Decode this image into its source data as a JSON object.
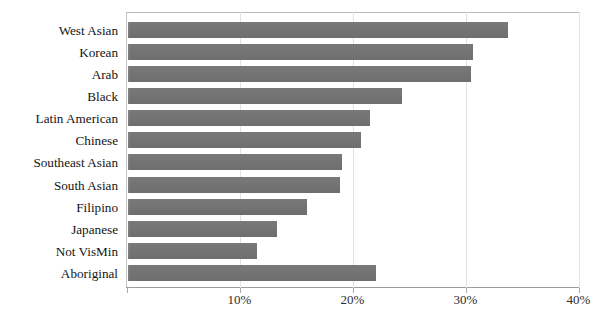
{
  "chart_data": {
    "type": "bar",
    "orientation": "horizontal",
    "title": "",
    "xlabel": "",
    "ylabel": "",
    "xlim": [
      0,
      40
    ],
    "xticks": [
      "10%",
      "20%",
      "30%",
      "40%"
    ],
    "xtick_values": [
      10,
      20,
      30,
      40
    ],
    "grid": true,
    "legend": null,
    "series_color": "#787878",
    "categories": [
      "West Asian",
      "Korean",
      "Arab",
      "Black",
      "Latin American",
      "Chinese",
      "Southeast Asian",
      "South Asian",
      "Filipino",
      "Japanese",
      "Not VisMin",
      "Aboriginal"
    ],
    "values": [
      33.7,
      30.6,
      30.4,
      24.3,
      21.5,
      20.7,
      19.0,
      18.8,
      15.9,
      13.2,
      11.5,
      22.0
    ]
  },
  "axis": {
    "x_tick_labels": [
      "10%",
      "20%",
      "30%",
      "40%"
    ]
  },
  "bars": [
    {
      "label": "West Asian",
      "value": 33.7
    },
    {
      "label": "Korean",
      "value": 30.6
    },
    {
      "label": "Arab",
      "value": 30.4
    },
    {
      "label": "Black",
      "value": 24.3
    },
    {
      "label": "Latin American",
      "value": 21.5
    },
    {
      "label": "Chinese",
      "value": 20.7
    },
    {
      "label": "Southeast Asian",
      "value": 19.0
    },
    {
      "label": "South Asian",
      "value": 18.8
    },
    {
      "label": "Filipino",
      "value": 15.9
    },
    {
      "label": "Japanese",
      "value": 13.2
    },
    {
      "label": "Not VisMin",
      "value": 11.5
    },
    {
      "label": "Aboriginal",
      "value": 22.0
    }
  ],
  "title": {
    "text": "",
    "clipped": true
  }
}
